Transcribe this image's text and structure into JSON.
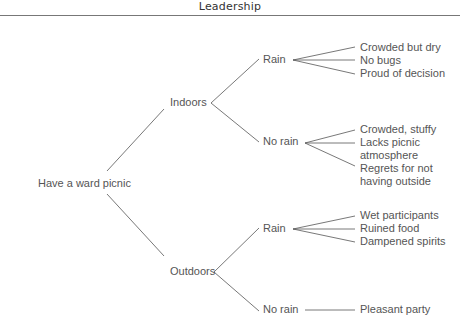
{
  "header": {
    "title": "Leadership"
  },
  "tree": {
    "root": "Have a ward picnic",
    "branches": [
      {
        "label": "Indoors",
        "outcomes": [
          {
            "label": "Rain",
            "results": [
              "Crowded but dry",
              "No bugs",
              "Proud of decision"
            ]
          },
          {
            "label": "No rain",
            "results": [
              "Crowded, stuffy",
              "Lacks picnic",
              "atmosphere",
              "Regrets for not",
              "having outside"
            ]
          }
        ]
      },
      {
        "label": "Outdoors",
        "outcomes": [
          {
            "label": "Rain",
            "results": [
              "Wet participants",
              "Ruined food",
              "Dampened spirits"
            ]
          },
          {
            "label": "No rain",
            "results": [
              "Pleasant party"
            ]
          }
        ]
      }
    ]
  }
}
